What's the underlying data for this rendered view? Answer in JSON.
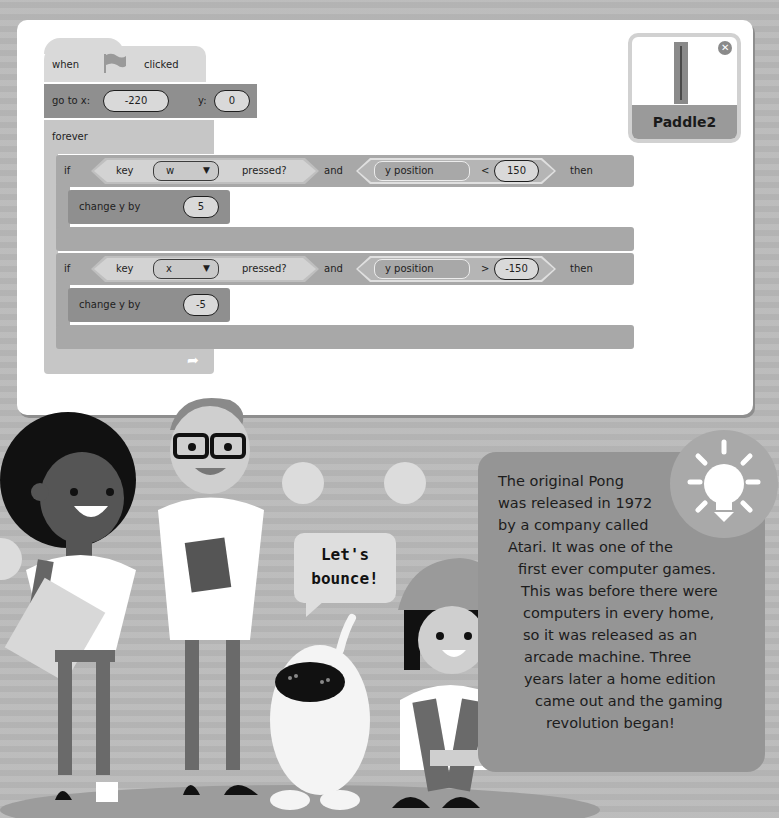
{
  "code": {
    "hat_block": {
      "when": "when",
      "flag_icon": "green-flag-icon",
      "clicked": "clicked"
    },
    "goto_block": {
      "label": "go to x:",
      "x_value": "-220",
      "y_label": "y:",
      "y_value": "0"
    },
    "forever_block": {
      "label": "forever",
      "loop_icon": "loop-arrow-icon"
    },
    "if_blocks": [
      {
        "if_label": "if",
        "key_label": "key",
        "key_value": "w",
        "pressed_label": "pressed?",
        "and_label": "and",
        "reporter": "y position",
        "operator": "<",
        "compare_value": "150",
        "then_label": "then",
        "change_label": "change y by",
        "change_value": "5"
      },
      {
        "if_label": "if",
        "key_label": "key",
        "key_value": "x",
        "pressed_label": "pressed?",
        "and_label": "and",
        "reporter": "y position",
        "operator": ">",
        "compare_value": "-150",
        "then_label": "then",
        "change_label": "change y by",
        "change_value": "-5"
      }
    ],
    "dropdown_caret": "▼"
  },
  "sprite": {
    "name": "Paddle2",
    "close_glyph": "✕"
  },
  "speech_bubble": {
    "line1": "Let's",
    "line2": "bounce!"
  },
  "fact_box": {
    "lines": [
      "The original Pong",
      "was released in 1972",
      "by a company called",
      "Atari. It was one of the",
      "first ever computer games.",
      "This was before there were",
      "computers in every home,",
      "so it was released as an",
      "arcade machine. Three",
      "years later a home edition",
      "came out and the gaming",
      "revolution began!"
    ],
    "icon": "lightbulb-icon"
  },
  "colors": {
    "background": "#b9b9b9",
    "panel": "#ffffff",
    "event_block": "#d9d9d9",
    "motion_block": "#8f8f8f",
    "control_block": "#c6c6c6",
    "if_block": "#a8a8a8",
    "fact_box": "#959595"
  }
}
